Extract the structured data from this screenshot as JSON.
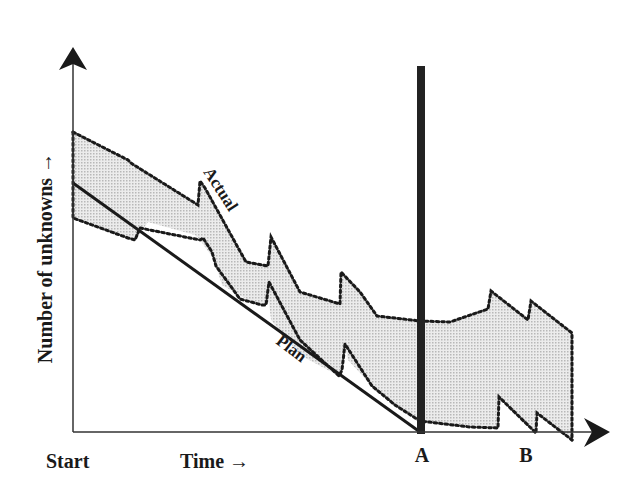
{
  "diagram": {
    "type": "project-unknowns-burndown",
    "y_axis_label": "Number of unknowns →",
    "x_axis_label": "Time →",
    "x_start_label": "Start",
    "milestones": [
      {
        "label": "A",
        "x": 422
      },
      {
        "label": "B",
        "x": 526
      }
    ],
    "series": [
      {
        "name": "Actual",
        "style": "dotted-band"
      },
      {
        "name": "Plan",
        "style": "solid-line"
      }
    ],
    "colors": {
      "ink": "#1a1a1a",
      "band_fill": "#d9d9d9",
      "background": "#ffffff"
    }
  }
}
